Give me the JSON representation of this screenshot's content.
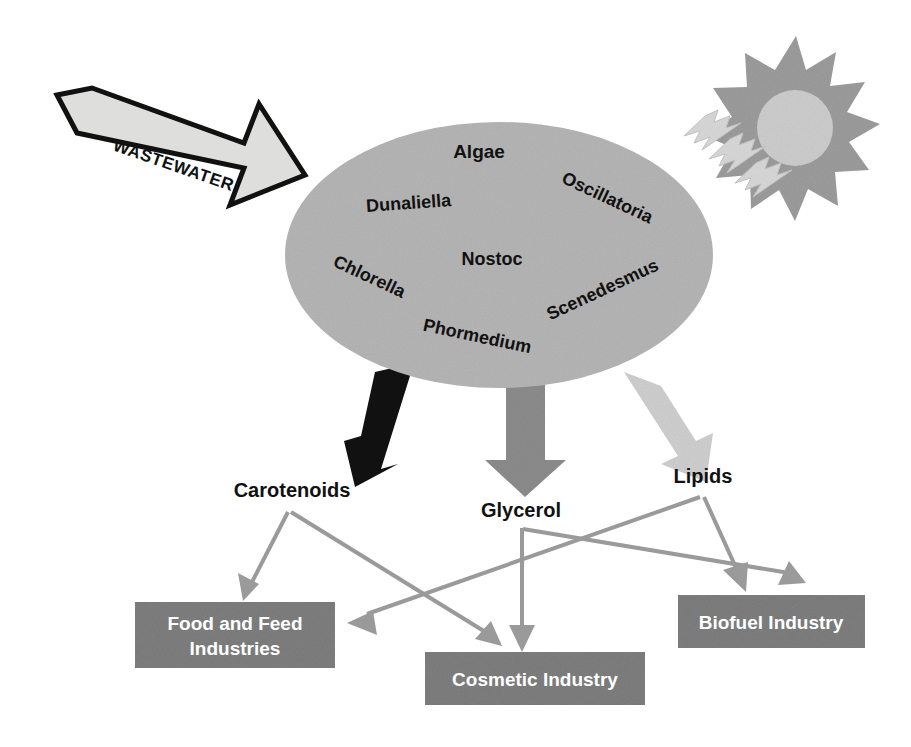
{
  "diagram": {
    "colors": {
      "pond_fill": "#b5b5b5",
      "box_fill": "#7e7e7e",
      "arrow_black": "#111111",
      "arrow_mid_gray": "#8c8c8c",
      "arrow_light_gray": "#cfcfcf",
      "connector_gray": "#9a9a9a",
      "sun_ray": "#9c9c9c",
      "sun_core": "#cccccc",
      "bolt_fill": "#d6d6d6",
      "wastewater_fill": "#dcdcdc",
      "wastewater_stroke": "#111111",
      "background": "#ffffff",
      "box_label": "#ffffff",
      "label_text": "#111111"
    },
    "input": {
      "label": "WASTEWATER",
      "icon": "block-arrow-icon"
    },
    "energy": {
      "sun_icon": "sun-icon",
      "bolt_icon": "lightning-bolt-icon",
      "bolt_count": 3
    },
    "pond": {
      "icon": "algae-pond-ellipse",
      "organisms": [
        {
          "name": "Algae",
          "x": 479,
          "y": 158,
          "rotate": 0,
          "size": 19
        },
        {
          "name": "Dunaliella",
          "x": 409,
          "y": 209,
          "rotate": -4,
          "size": 18
        },
        {
          "name": "Oscillatoria",
          "x": 605,
          "y": 203,
          "rotate": 25,
          "size": 18
        },
        {
          "name": "Nostoc",
          "x": 492,
          "y": 265,
          "rotate": 0,
          "size": 18
        },
        {
          "name": "Chlorella",
          "x": 367,
          "y": 282,
          "rotate": 25,
          "size": 18
        },
        {
          "name": "Scenedesmus",
          "x": 605,
          "y": 295,
          "rotate": -25,
          "size": 18
        },
        {
          "name": "Phormedium",
          "x": 476,
          "y": 342,
          "rotate": 12,
          "size": 18
        }
      ]
    },
    "products": [
      {
        "id": "carotenoids",
        "label": "Carotenoids",
        "arrow": "black-down-arrow",
        "x": 292,
        "y": 493
      },
      {
        "id": "glycerol",
        "label": "Glycerol",
        "arrow": "gray-down-arrow",
        "x": 521,
        "y": 510
      },
      {
        "id": "lipids",
        "label": "Lipids",
        "arrow": "light-gray-down-arrow",
        "x": 703,
        "y": 476
      }
    ],
    "industries": [
      {
        "id": "food-and-feed",
        "lines": [
          "Food and Feed",
          "Industries"
        ],
        "x": 135,
        "y": 602,
        "w": 200,
        "h": 66
      },
      {
        "id": "cosmetic",
        "lines": [
          "Cosmetic Industry"
        ],
        "x": 425,
        "y": 652,
        "w": 220,
        "h": 53
      },
      {
        "id": "biofuel",
        "lines": [
          "Biofuel Industry"
        ],
        "x": 678,
        "y": 595,
        "w": 187,
        "h": 53
      }
    ],
    "connections": [
      {
        "id": "carotenoids-to-food",
        "from": "carotenoids",
        "to": "food-and-feed"
      },
      {
        "id": "carotenoids-to-cosmetic",
        "from": "carotenoids",
        "to": "cosmetic"
      },
      {
        "id": "glycerol-to-cosmetic",
        "from": "glycerol",
        "to": "cosmetic"
      },
      {
        "id": "glycerol-to-biofuel",
        "from": "glycerol",
        "to": "biofuel"
      },
      {
        "id": "lipids-to-food",
        "from": "lipids",
        "to": "food-and-feed"
      },
      {
        "id": "lipids-to-biofuel",
        "from": "lipids",
        "to": "biofuel"
      }
    ]
  }
}
